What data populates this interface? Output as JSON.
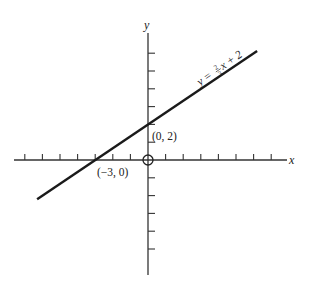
{
  "chart_data": {
    "type": "line",
    "title": "",
    "xlabel": "x",
    "ylabel": "y",
    "grid": false,
    "origin_marker": "circle",
    "xlim": [
      -7.7,
      8.0
    ],
    "ylim": [
      -6.5,
      7.2
    ],
    "x_ticks": [
      -7,
      -6,
      -5,
      -4,
      -3,
      -2,
      -1,
      1,
      2,
      3,
      4,
      5,
      6,
      7
    ],
    "y_ticks": [
      -5,
      -4,
      -3,
      -2,
      -1,
      1,
      2,
      3,
      4,
      5,
      6
    ],
    "tick_labels_shown": false,
    "series": [
      {
        "name": "y = 2/3 x + 2",
        "equation": "y = (2/3)x + 2",
        "slope": 0.6667,
        "intercept": 2,
        "x": [
          -6.3,
          6.2
        ],
        "y": [
          -2.2,
          6.13
        ]
      }
    ],
    "annotations": [
      {
        "text": "(0, 2)",
        "x": 0,
        "y": 2
      },
      {
        "text": "(−3, 0)",
        "x": -3,
        "y": 0
      },
      {
        "text": "y = ⅔x + 2",
        "along_line": true
      }
    ]
  },
  "labels": {
    "x_axis": "x",
    "y_axis": "y",
    "point_intercept_y": "(0, 2)",
    "point_intercept_x": "(−3, 0)",
    "equation_prefix": "y = ",
    "equation_num": "2",
    "equation_den": "3",
    "equation_suffix": "x + 2"
  }
}
